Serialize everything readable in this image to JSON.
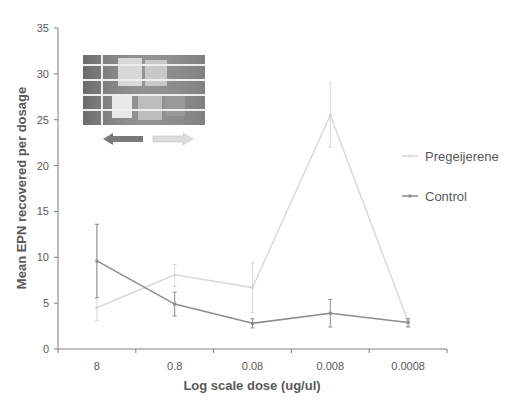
{
  "chart_data": {
    "type": "line",
    "title": "",
    "xlabel": "Log scale dose (ug/ul)",
    "ylabel": "Mean EPN recovered per dosage",
    "categories": [
      "8",
      "0.8",
      "0.08",
      "0.008",
      "0.0008"
    ],
    "ylim": [
      0,
      35
    ],
    "yticks": [
      0,
      5,
      10,
      15,
      20,
      25,
      30,
      35
    ],
    "grid": false,
    "legend_position": "right",
    "series": [
      {
        "name": "Pregeijerene",
        "color": "#d9d9d9",
        "values": [
          4.5,
          8.1,
          6.7,
          25.5,
          3.0
        ],
        "err_low": [
          3.1,
          6.8,
          4.0,
          22.0,
          2.5
        ],
        "err_high": [
          13.6,
          9.2,
          9.4,
          29.0,
          3.3
        ]
      },
      {
        "name": "Control",
        "color": "#8c8c8c",
        "values": [
          9.6,
          4.9,
          2.8,
          3.9,
          2.9
        ],
        "err_low": [
          5.6,
          3.6,
          2.3,
          2.4,
          2.4
        ],
        "err_high": [
          13.6,
          6.2,
          3.3,
          5.4,
          3.3
        ]
      }
    ],
    "annotations": [
      "inset photo of well plate",
      "left arrow (dark)",
      "right arrow (light)"
    ]
  }
}
